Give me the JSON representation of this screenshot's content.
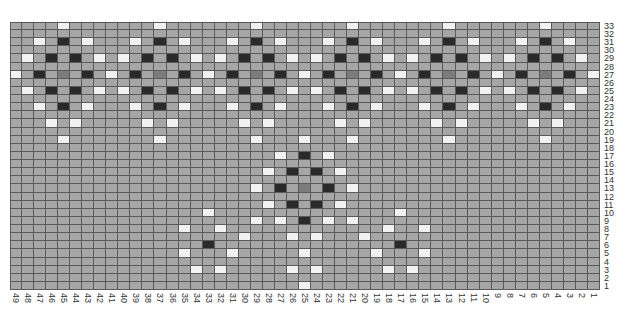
{
  "chart_data": {
    "type": "heatmap",
    "title": "",
    "columns": 49,
    "rows": 33,
    "x_labels": [
      "49",
      "48",
      "47",
      "46",
      "45",
      "44",
      "43",
      "42",
      "41",
      "40",
      "39",
      "38",
      "37",
      "36",
      "35",
      "34",
      "33",
      "32",
      "31",
      "30",
      "29",
      "28",
      "27",
      "26",
      "25",
      "24",
      "23",
      "22",
      "21",
      "20",
      "19",
      "18",
      "17",
      "16",
      "15",
      "14",
      "13",
      "12",
      "11",
      "10",
      "9",
      "8",
      "7",
      "6",
      "5",
      "4",
      "3",
      "2",
      "1"
    ],
    "y_labels": [
      "33",
      "32",
      "31",
      "30",
      "29",
      "28",
      "27",
      "26",
      "25",
      "24",
      "23",
      "22",
      "21",
      "20",
      "19",
      "18",
      "17",
      "16",
      "15",
      "14",
      "13",
      "12",
      "11",
      "10",
      "9",
      "8",
      "7",
      "6",
      "5",
      "4",
      "3",
      "2",
      "1"
    ],
    "legend": {
      "base": "#a6a6a6",
      "W": "#f2f2f2",
      "D": "#2a2a2a",
      "M": "#7c7c7c"
    },
    "grid_line_color": "#5a5a5a",
    "cells": [
      {
        "row": 33,
        "col": 45,
        "v": "W"
      },
      {
        "row": 33,
        "col": 37,
        "v": "W"
      },
      {
        "row": 33,
        "col": 29,
        "v": "W"
      },
      {
        "row": 33,
        "col": 21,
        "v": "W"
      },
      {
        "row": 33,
        "col": 13,
        "v": "W"
      },
      {
        "row": 33,
        "col": 5,
        "v": "W"
      },
      {
        "row": 31,
        "col": 47,
        "v": "W"
      },
      {
        "row": 31,
        "col": 45,
        "v": "D"
      },
      {
        "row": 31,
        "col": 43,
        "v": "W"
      },
      {
        "row": 31,
        "col": 39,
        "v": "W"
      },
      {
        "row": 31,
        "col": 37,
        "v": "D"
      },
      {
        "row": 31,
        "col": 35,
        "v": "W"
      },
      {
        "row": 31,
        "col": 31,
        "v": "W"
      },
      {
        "row": 31,
        "col": 29,
        "v": "D"
      },
      {
        "row": 31,
        "col": 27,
        "v": "W"
      },
      {
        "row": 31,
        "col": 23,
        "v": "W"
      },
      {
        "row": 31,
        "col": 21,
        "v": "D"
      },
      {
        "row": 31,
        "col": 19,
        "v": "W"
      },
      {
        "row": 31,
        "col": 15,
        "v": "W"
      },
      {
        "row": 31,
        "col": 13,
        "v": "D"
      },
      {
        "row": 31,
        "col": 11,
        "v": "W"
      },
      {
        "row": 31,
        "col": 7,
        "v": "W"
      },
      {
        "row": 31,
        "col": 5,
        "v": "D"
      },
      {
        "row": 31,
        "col": 3,
        "v": "W"
      },
      {
        "row": 29,
        "col": 48,
        "v": "W"
      },
      {
        "row": 29,
        "col": 46,
        "v": "D"
      },
      {
        "row": 29,
        "col": 44,
        "v": "D"
      },
      {
        "row": 29,
        "col": 42,
        "v": "W"
      },
      {
        "row": 29,
        "col": 40,
        "v": "W"
      },
      {
        "row": 29,
        "col": 38,
        "v": "D"
      },
      {
        "row": 29,
        "col": 36,
        "v": "D"
      },
      {
        "row": 29,
        "col": 34,
        "v": "W"
      },
      {
        "row": 29,
        "col": 32,
        "v": "W"
      },
      {
        "row": 29,
        "col": 30,
        "v": "D"
      },
      {
        "row": 29,
        "col": 28,
        "v": "D"
      },
      {
        "row": 29,
        "col": 26,
        "v": "W"
      },
      {
        "row": 29,
        "col": 24,
        "v": "W"
      },
      {
        "row": 29,
        "col": 22,
        "v": "D"
      },
      {
        "row": 29,
        "col": 20,
        "v": "D"
      },
      {
        "row": 29,
        "col": 18,
        "v": "W"
      },
      {
        "row": 29,
        "col": 16,
        "v": "W"
      },
      {
        "row": 29,
        "col": 14,
        "v": "D"
      },
      {
        "row": 29,
        "col": 12,
        "v": "D"
      },
      {
        "row": 29,
        "col": 10,
        "v": "W"
      },
      {
        "row": 29,
        "col": 8,
        "v": "W"
      },
      {
        "row": 29,
        "col": 6,
        "v": "D"
      },
      {
        "row": 29,
        "col": 4,
        "v": "D"
      },
      {
        "row": 29,
        "col": 2,
        "v": "W"
      },
      {
        "row": 27,
        "col": 49,
        "v": "W"
      },
      {
        "row": 27,
        "col": 47,
        "v": "D"
      },
      {
        "row": 27,
        "col": 45,
        "v": "M"
      },
      {
        "row": 27,
        "col": 43,
        "v": "D"
      },
      {
        "row": 27,
        "col": 41,
        "v": "W"
      },
      {
        "row": 27,
        "col": 39,
        "v": "D"
      },
      {
        "row": 27,
        "col": 37,
        "v": "M"
      },
      {
        "row": 27,
        "col": 35,
        "v": "D"
      },
      {
        "row": 27,
        "col": 33,
        "v": "W"
      },
      {
        "row": 27,
        "col": 31,
        "v": "D"
      },
      {
        "row": 27,
        "col": 29,
        "v": "M"
      },
      {
        "row": 27,
        "col": 27,
        "v": "D"
      },
      {
        "row": 27,
        "col": 25,
        "v": "W"
      },
      {
        "row": 27,
        "col": 23,
        "v": "D"
      },
      {
        "row": 27,
        "col": 21,
        "v": "M"
      },
      {
        "row": 27,
        "col": 19,
        "v": "D"
      },
      {
        "row": 27,
        "col": 17,
        "v": "W"
      },
      {
        "row": 27,
        "col": 15,
        "v": "D"
      },
      {
        "row": 27,
        "col": 13,
        "v": "M"
      },
      {
        "row": 27,
        "col": 11,
        "v": "D"
      },
      {
        "row": 27,
        "col": 9,
        "v": "W"
      },
      {
        "row": 27,
        "col": 7,
        "v": "D"
      },
      {
        "row": 27,
        "col": 5,
        "v": "M"
      },
      {
        "row": 27,
        "col": 3,
        "v": "D"
      },
      {
        "row": 27,
        "col": 1,
        "v": "W"
      },
      {
        "row": 25,
        "col": 48,
        "v": "W"
      },
      {
        "row": 25,
        "col": 46,
        "v": "D"
      },
      {
        "row": 25,
        "col": 44,
        "v": "D"
      },
      {
        "row": 25,
        "col": 42,
        "v": "W"
      },
      {
        "row": 25,
        "col": 40,
        "v": "W"
      },
      {
        "row": 25,
        "col": 38,
        "v": "D"
      },
      {
        "row": 25,
        "col": 36,
        "v": "D"
      },
      {
        "row": 25,
        "col": 34,
        "v": "W"
      },
      {
        "row": 25,
        "col": 32,
        "v": "W"
      },
      {
        "row": 25,
        "col": 30,
        "v": "D"
      },
      {
        "row": 25,
        "col": 28,
        "v": "D"
      },
      {
        "row": 25,
        "col": 26,
        "v": "W"
      },
      {
        "row": 25,
        "col": 24,
        "v": "W"
      },
      {
        "row": 25,
        "col": 22,
        "v": "D"
      },
      {
        "row": 25,
        "col": 20,
        "v": "D"
      },
      {
        "row": 25,
        "col": 18,
        "v": "W"
      },
      {
        "row": 25,
        "col": 16,
        "v": "W"
      },
      {
        "row": 25,
        "col": 14,
        "v": "D"
      },
      {
        "row": 25,
        "col": 12,
        "v": "D"
      },
      {
        "row": 25,
        "col": 10,
        "v": "W"
      },
      {
        "row": 25,
        "col": 8,
        "v": "W"
      },
      {
        "row": 25,
        "col": 6,
        "v": "D"
      },
      {
        "row": 25,
        "col": 4,
        "v": "D"
      },
      {
        "row": 25,
        "col": 2,
        "v": "W"
      },
      {
        "row": 23,
        "col": 47,
        "v": "W"
      },
      {
        "row": 23,
        "col": 45,
        "v": "D"
      },
      {
        "row": 23,
        "col": 43,
        "v": "W"
      },
      {
        "row": 23,
        "col": 39,
        "v": "W"
      },
      {
        "row": 23,
        "col": 37,
        "v": "D"
      },
      {
        "row": 23,
        "col": 35,
        "v": "W"
      },
      {
        "row": 23,
        "col": 31,
        "v": "W"
      },
      {
        "row": 23,
        "col": 29,
        "v": "D"
      },
      {
        "row": 23,
        "col": 27,
        "v": "W"
      },
      {
        "row": 23,
        "col": 23,
        "v": "W"
      },
      {
        "row": 23,
        "col": 21,
        "v": "D"
      },
      {
        "row": 23,
        "col": 19,
        "v": "W"
      },
      {
        "row": 23,
        "col": 15,
        "v": "W"
      },
      {
        "row": 23,
        "col": 13,
        "v": "D"
      },
      {
        "row": 23,
        "col": 11,
        "v": "W"
      },
      {
        "row": 23,
        "col": 7,
        "v": "W"
      },
      {
        "row": 23,
        "col": 5,
        "v": "D"
      },
      {
        "row": 23,
        "col": 3,
        "v": "W"
      },
      {
        "row": 21,
        "col": 46,
        "v": "W"
      },
      {
        "row": 21,
        "col": 44,
        "v": "W"
      },
      {
        "row": 21,
        "col": 38,
        "v": "W"
      },
      {
        "row": 21,
        "col": 36,
        "v": "W"
      },
      {
        "row": 21,
        "col": 30,
        "v": "W"
      },
      {
        "row": 21,
        "col": 28,
        "v": "W"
      },
      {
        "row": 21,
        "col": 22,
        "v": "W"
      },
      {
        "row": 21,
        "col": 20,
        "v": "W"
      },
      {
        "row": 21,
        "col": 14,
        "v": "W"
      },
      {
        "row": 21,
        "col": 12,
        "v": "W"
      },
      {
        "row": 21,
        "col": 6,
        "v": "W"
      },
      {
        "row": 21,
        "col": 4,
        "v": "W"
      },
      {
        "row": 19,
        "col": 45,
        "v": "W"
      },
      {
        "row": 19,
        "col": 37,
        "v": "W"
      },
      {
        "row": 19,
        "col": 29,
        "v": "W"
      },
      {
        "row": 19,
        "col": 25,
        "v": "W"
      },
      {
        "row": 19,
        "col": 21,
        "v": "W"
      },
      {
        "row": 19,
        "col": 13,
        "v": "W"
      },
      {
        "row": 19,
        "col": 5,
        "v": "W"
      },
      {
        "row": 17,
        "col": 27,
        "v": "W"
      },
      {
        "row": 17,
        "col": 25,
        "v": "D"
      },
      {
        "row": 17,
        "col": 23,
        "v": "W"
      },
      {
        "row": 15,
        "col": 28,
        "v": "W"
      },
      {
        "row": 15,
        "col": 26,
        "v": "D"
      },
      {
        "row": 15,
        "col": 24,
        "v": "D"
      },
      {
        "row": 15,
        "col": 22,
        "v": "W"
      },
      {
        "row": 13,
        "col": 29,
        "v": "W"
      },
      {
        "row": 13,
        "col": 27,
        "v": "D"
      },
      {
        "row": 13,
        "col": 25,
        "v": "M"
      },
      {
        "row": 13,
        "col": 23,
        "v": "D"
      },
      {
        "row": 13,
        "col": 21,
        "v": "W"
      },
      {
        "row": 11,
        "col": 28,
        "v": "W"
      },
      {
        "row": 11,
        "col": 26,
        "v": "D"
      },
      {
        "row": 11,
        "col": 24,
        "v": "D"
      },
      {
        "row": 11,
        "col": 22,
        "v": "W"
      },
      {
        "row": 10,
        "col": 33,
        "v": "W"
      },
      {
        "row": 10,
        "col": 17,
        "v": "W"
      },
      {
        "row": 9,
        "col": 29,
        "v": "W"
      },
      {
        "row": 9,
        "col": 27,
        "v": "W"
      },
      {
        "row": 9,
        "col": 25,
        "v": "D"
      },
      {
        "row": 9,
        "col": 23,
        "v": "W"
      },
      {
        "row": 9,
        "col": 21,
        "v": "W"
      },
      {
        "row": 8,
        "col": 35,
        "v": "W"
      },
      {
        "row": 8,
        "col": 32,
        "v": "W"
      },
      {
        "row": 8,
        "col": 18,
        "v": "W"
      },
      {
        "row": 8,
        "col": 15,
        "v": "W"
      },
      {
        "row": 7,
        "col": 30,
        "v": "W"
      },
      {
        "row": 7,
        "col": 26,
        "v": "W"
      },
      {
        "row": 7,
        "col": 24,
        "v": "W"
      },
      {
        "row": 7,
        "col": 20,
        "v": "W"
      },
      {
        "row": 6,
        "col": 33,
        "v": "D"
      },
      {
        "row": 6,
        "col": 17,
        "v": "D"
      },
      {
        "row": 5,
        "col": 35,
        "v": "W"
      },
      {
        "row": 5,
        "col": 31,
        "v": "W"
      },
      {
        "row": 5,
        "col": 25,
        "v": "W"
      },
      {
        "row": 5,
        "col": 19,
        "v": "W"
      },
      {
        "row": 5,
        "col": 15,
        "v": "W"
      },
      {
        "row": 3,
        "col": 34,
        "v": "W"
      },
      {
        "row": 3,
        "col": 32,
        "v": "W"
      },
      {
        "row": 3,
        "col": 26,
        "v": "W"
      },
      {
        "row": 3,
        "col": 24,
        "v": "W"
      },
      {
        "row": 3,
        "col": 18,
        "v": "W"
      },
      {
        "row": 3,
        "col": 16,
        "v": "W"
      },
      {
        "row": 1,
        "col": 25,
        "v": "W"
      }
    ],
    "grid": true,
    "legend_position": "none"
  }
}
